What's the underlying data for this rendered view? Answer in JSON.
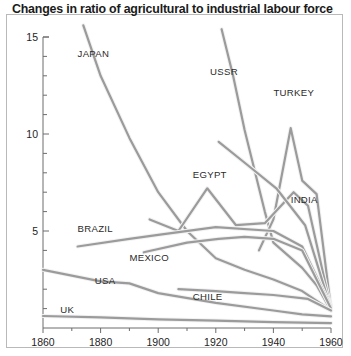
{
  "chart_data": {
    "type": "line",
    "title": "Changes in ratio of agricultural to industrial labour force",
    "xlabel": "",
    "ylabel": "Agricultural labour force/industrial labour force",
    "xlim": [
      1860,
      1960
    ],
    "ylim": [
      0,
      15
    ],
    "xticks": [
      "1860",
      "1880",
      "1900",
      "1920",
      "1940",
      "1960"
    ],
    "yticks": [
      "5",
      "10",
      "15"
    ],
    "grid": false,
    "legend_position": "inline-labels",
    "series": [
      {
        "name": "JAPAN",
        "label_x": 1872,
        "label_y": 14.1,
        "x": [
          1874,
          1880,
          1890,
          1900,
          1910,
          1920,
          1930,
          1940,
          1950,
          1960
        ],
        "y": [
          15.6,
          13.0,
          9.8,
          7.0,
          5.0,
          3.6,
          3.0,
          2.5,
          1.9,
          0.9
        ]
      },
      {
        "name": "USSR",
        "label_x": 1918,
        "label_y": 13.2,
        "x": [
          1922,
          1926,
          1930,
          1937,
          1940,
          1950,
          1955,
          1960
        ],
        "y": [
          15.4,
          13.0,
          10.2,
          6.0,
          4.4,
          3.1,
          2.2,
          0.9
        ]
      },
      {
        "name": "TURKEY",
        "label_x": 1940,
        "label_y": 12.1,
        "x": [
          1935,
          1940,
          1946,
          1950,
          1955,
          1960
        ],
        "y": [
          4.0,
          5.6,
          10.3,
          7.6,
          6.9,
          1.0
        ]
      },
      {
        "name": "EGYPT",
        "label_x": 1912,
        "label_y": 7.9,
        "x": [
          1897,
          1907,
          1917,
          1927,
          1937,
          1947,
          1952,
          1960
        ],
        "y": [
          5.6,
          5.0,
          7.2,
          5.3,
          5.4,
          7.0,
          6.3,
          1.0
        ]
      },
      {
        "name": "INDIA",
        "label_x": 1946,
        "label_y": 6.6,
        "x": [
          1921,
          1931,
          1941,
          1951,
          1960
        ],
        "y": [
          9.6,
          8.4,
          7.2,
          5.3,
          1.0
        ]
      },
      {
        "name": "BRAZIL",
        "label_x": 1872,
        "label_y": 5.1,
        "x": [
          1872,
          1890,
          1900,
          1920,
          1940,
          1950,
          1960
        ],
        "y": [
          4.2,
          4.6,
          4.8,
          5.2,
          5.0,
          4.2,
          1.1
        ]
      },
      {
        "name": "MEXICO",
        "label_x": 1890,
        "label_y": 3.6,
        "x": [
          1895,
          1910,
          1921,
          1930,
          1940,
          1950,
          1960
        ],
        "y": [
          3.9,
          4.4,
          4.6,
          4.7,
          4.6,
          4.0,
          1.0
        ]
      },
      {
        "name": "USA",
        "label_x": 1878,
        "label_y": 2.4,
        "x": [
          1860,
          1880,
          1890,
          1900,
          1920,
          1940,
          1950,
          1960
        ],
        "y": [
          3.0,
          2.4,
          2.3,
          1.8,
          1.3,
          0.9,
          0.7,
          0.6
        ]
      },
      {
        "name": "CHILE",
        "label_x": 1912,
        "label_y": 1.6,
        "x": [
          1907,
          1920,
          1930,
          1940,
          1952,
          1960
        ],
        "y": [
          2.0,
          1.9,
          1.8,
          1.7,
          1.5,
          0.9
        ]
      },
      {
        "name": "UK",
        "label_x": 1866,
        "label_y": 0.95,
        "x": [
          1860,
          1880,
          1900,
          1920,
          1940,
          1960
        ],
        "y": [
          0.62,
          0.55,
          0.45,
          0.38,
          0.3,
          0.25
        ]
      }
    ]
  },
  "colors": {
    "line": "#9b9b9b",
    "highlight": "#f2f2f2",
    "axis": "#6d6d6d",
    "text": "#242424",
    "border": "#b9b9b9"
  }
}
